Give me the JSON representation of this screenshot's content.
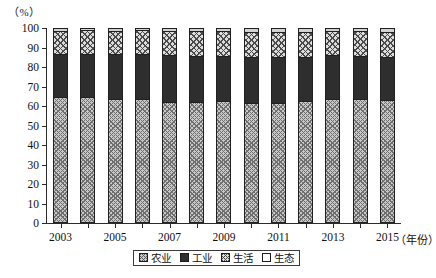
{
  "chart_data": {
    "type": "bar",
    "stacked": true,
    "normalized_percent": true,
    "title": "",
    "subtitle": "",
    "xlabel": "年份",
    "ylabel": "（%）",
    "ylim": [
      0,
      100
    ],
    "ytick_step": 10,
    "yticks": [
      0,
      10,
      20,
      30,
      40,
      50,
      60,
      70,
      80,
      90,
      100
    ],
    "grid": false,
    "legend_position": "bottom-center",
    "categories": [
      "2003",
      "2004",
      "2005",
      "2006",
      "2007",
      "2008",
      "2009",
      "2010",
      "2011",
      "2012",
      "2013",
      "2014",
      "2015"
    ],
    "xtick_labels_shown": [
      "2003",
      "2005",
      "2007",
      "2009",
      "2011",
      "2013",
      "2015"
    ],
    "series": [
      {
        "name": "农业",
        "values": [
          64.5,
          64.5,
          63.8,
          63.5,
          62.1,
          62.0,
          62.4,
          61.3,
          61.3,
          62.7,
          63.4,
          63.5,
          63.1
        ]
      },
      {
        "name": "工业",
        "values": [
          22.1,
          22.2,
          22.8,
          23.2,
          24.1,
          23.7,
          23.3,
          24.0,
          23.9,
          22.5,
          22.8,
          22.2,
          21.9
        ]
      },
      {
        "name": "生活",
        "values": [
          12.1,
          12.1,
          12.1,
          12.2,
          12.2,
          12.6,
          12.6,
          12.7,
          12.8,
          12.9,
          12.1,
          12.6,
          13.0
        ]
      },
      {
        "name": "生态",
        "values": [
          1.3,
          1.2,
          1.3,
          1.1,
          1.6,
          1.7,
          1.7,
          2.0,
          2.0,
          1.9,
          1.7,
          1.7,
          2.0
        ]
      }
    ]
  },
  "legend": {
    "items": [
      {
        "label": "农业",
        "swatch": "agri",
        "color": "#c9c9c9"
      },
      {
        "label": "工业",
        "swatch": "ind",
        "color": "#2e2e2e"
      },
      {
        "label": "生活",
        "swatch": "life",
        "color": "#dcdcdc"
      },
      {
        "label": "生态",
        "swatch": "eco",
        "color": "#ffffff"
      }
    ]
  },
  "axes": {
    "y_unit": "（%）",
    "x_unit": "（年份）"
  }
}
